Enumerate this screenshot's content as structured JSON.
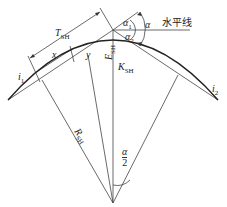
{
  "diagram": {
    "type": "vertical-curve-geometry",
    "labels": {
      "tangent": "T",
      "tangent_sub": "SH",
      "x": "x",
      "y": "y",
      "external": "E",
      "external_sub": "SH",
      "curve": "K",
      "curve_sub": "SH",
      "radius": "R",
      "radius_sub": "SH",
      "grade1": "i",
      "grade1_sub": "1",
      "grade2": "i",
      "grade2_sub": "2",
      "alpha": "α",
      "alpha1": "α",
      "alpha1_sub": "1",
      "alpha2": "α",
      "alpha2_sub": "2",
      "half_alpha_num": "α",
      "half_alpha_den": "2",
      "horizontal_line": "水平线"
    },
    "colors": {
      "line": "#333333",
      "curve": "#222222"
    }
  }
}
